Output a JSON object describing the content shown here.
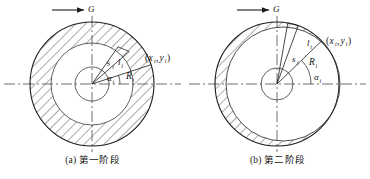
{
  "figure": {
    "width": 370,
    "height": 179,
    "background": "#ffffff",
    "line_color": "#1a1a1a",
    "hatch_color": "#2b2b2b"
  },
  "panels": [
    {
      "id": "a",
      "caption": "(a) 第一阶段",
      "load_arrow_label": "G",
      "center": {
        "x": 92,
        "y": 84
      },
      "outer_radius": 62,
      "middle_radius": 41,
      "inner_radius": 17,
      "hatched_region": "annulus-between-outer-and-middle",
      "labels": {
        "arc_length": "s",
        "chord": "l",
        "radius": "R",
        "angle": "α",
        "subscript": "i",
        "point": "(x , y )",
        "point_full": "(x_i , y_i)"
      },
      "radial_lines_deg": [
        65,
        52,
        18
      ],
      "angle_arc_deg": 18
    },
    {
      "id": "b",
      "caption": "(b) 第二阶段",
      "load_arrow_label": "G",
      "center": {
        "x": 92,
        "y": 84
      },
      "outer_radius": 62,
      "inner_offset_radius": 57,
      "inner_offset_dx": 6,
      "inner_radius": 16,
      "hatched_region": "crescent-left",
      "labels": {
        "arc_length": "s",
        "chord": "l",
        "radius": "R",
        "angle": "α",
        "subscript": "i",
        "point": "(x , y )",
        "point_full": "(x_i , y_i)"
      },
      "radial_lines_deg": [
        80,
        70,
        44
      ],
      "angle_arc_deg": 44
    }
  ]
}
